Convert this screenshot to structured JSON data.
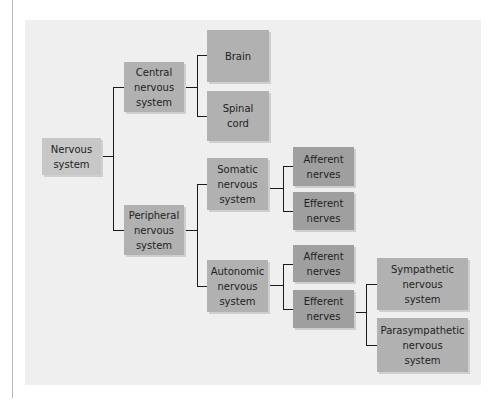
{
  "diagram": {
    "type": "hierarchy",
    "title": "",
    "nodes": {
      "nervous_system": "Nervous\nsystem",
      "central": "Central\nnervous\nsystem",
      "brain": "Brain",
      "spinal_cord": "Spinal\ncord",
      "peripheral": "Peripheral\nnervous\nsystem",
      "somatic": "Somatic\nnervous\nsystem",
      "somatic_afferent": "Afferent\nnerves",
      "somatic_efferent": "Efferent\nnerves",
      "autonomic": "Autonomic\nnervous\nsystem",
      "autonomic_afferent": "Afferent\nnerves",
      "autonomic_efferent": "Efferent\nnerves",
      "sympathetic": "Sympathetic\nnervous\nsystem",
      "parasympathetic": "Parasympathetic\nnervous\nsystem"
    },
    "edges": [
      [
        "nervous_system",
        "central"
      ],
      [
        "nervous_system",
        "peripheral"
      ],
      [
        "central",
        "brain"
      ],
      [
        "central",
        "spinal_cord"
      ],
      [
        "peripheral",
        "somatic"
      ],
      [
        "peripheral",
        "autonomic"
      ],
      [
        "somatic",
        "somatic_afferent"
      ],
      [
        "somatic",
        "somatic_efferent"
      ],
      [
        "autonomic",
        "autonomic_afferent"
      ],
      [
        "autonomic",
        "autonomic_efferent"
      ],
      [
        "autonomic_efferent",
        "sympathetic"
      ],
      [
        "autonomic_efferent",
        "parasympathetic"
      ]
    ],
    "colors": {
      "panel": "#efefef",
      "node": "#b1b1b1",
      "node_nerves": "#9f9f9f",
      "node_root": "#c7c7c7",
      "line": "#1a1a1a"
    }
  }
}
